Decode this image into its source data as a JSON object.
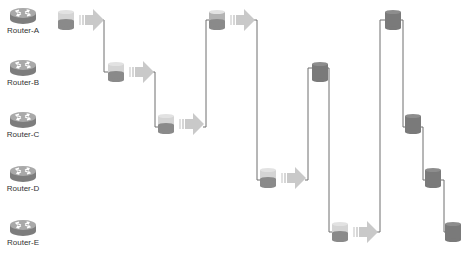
{
  "diagram": {
    "type": "packet-flow-timing",
    "routers": [
      {
        "id": "A",
        "label": "Router-A",
        "y": 20
      },
      {
        "id": "B",
        "label": "Router-B",
        "y": 72
      },
      {
        "id": "C",
        "label": "Router-C",
        "y": 124
      },
      {
        "id": "D",
        "label": "Router-D",
        "y": 178
      },
      {
        "id": "E",
        "label": "Router-E",
        "y": 232
      }
    ],
    "hops": [
      {
        "router": "A",
        "x": 58,
        "style": "light",
        "arrow": true
      },
      {
        "router": "B",
        "x": 108,
        "style": "light",
        "arrow": true
      },
      {
        "router": "C",
        "x": 158,
        "style": "light",
        "arrow": true
      },
      {
        "router": "A",
        "x": 209,
        "style": "mid",
        "arrow": true
      },
      {
        "router": "D",
        "x": 260,
        "style": "light",
        "arrow": true
      },
      {
        "router": "B",
        "x": 312,
        "style": "dark",
        "arrow": false
      },
      {
        "router": "E",
        "x": 332,
        "style": "light",
        "arrow": true
      },
      {
        "router": "A",
        "x": 385,
        "style": "dark",
        "arrow": false
      },
      {
        "router": "C",
        "x": 405,
        "style": "dark",
        "arrow": false
      },
      {
        "router": "D",
        "x": 425,
        "style": "dark",
        "arrow": false
      },
      {
        "router": "E",
        "x": 445,
        "style": "dark",
        "arrow": false
      }
    ],
    "connectors": [
      {
        "x": 104,
        "y1": 20,
        "y2": 72,
        "from_x": 104,
        "to_x": 108
      },
      {
        "x": 155,
        "y1": 72,
        "y2": 127,
        "from_x": 155,
        "to_x": 158
      },
      {
        "x": 206,
        "y1": 127,
        "y2": 20,
        "from_x": 206,
        "to_x": 209
      },
      {
        "x": 257,
        "y1": 20,
        "y2": 180,
        "from_x": 257,
        "to_x": 260
      },
      {
        "x": 308,
        "y1": 180,
        "y2": 68,
        "from_x": 308,
        "to_x": 312
      },
      {
        "x": 329,
        "y1": 68,
        "y2": 232,
        "from_x": 327,
        "to_x": 332
      },
      {
        "x": 380,
        "y1": 232,
        "y2": 20,
        "from_x": 380,
        "to_x": 385
      },
      {
        "x": 403,
        "y1": 20,
        "y2": 127,
        "from_x": 401,
        "to_x": 405
      },
      {
        "x": 423,
        "y1": 127,
        "y2": 180,
        "from_x": 421,
        "to_x": 425
      },
      {
        "x": 444,
        "y1": 180,
        "y2": 232,
        "from_x": 441,
        "to_x": 445
      }
    ],
    "colors": {
      "router_body": "#7d7d7d",
      "router_top": "#a9a9a9",
      "cyl_light_top": "#d4d4d4",
      "cyl_light_bottom": "#8a8a8a",
      "cyl_dark": "#7a7a7a",
      "arrow": "#c9c9c9",
      "line": "#6e6e6e",
      "label": "#333333"
    }
  }
}
